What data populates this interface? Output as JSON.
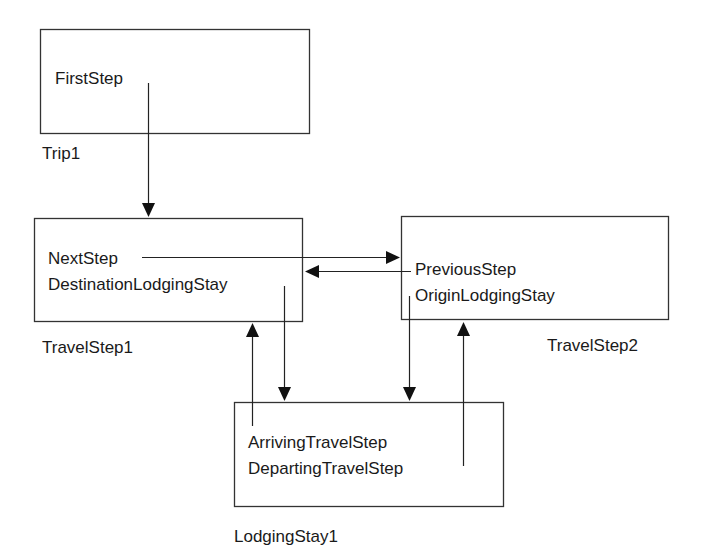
{
  "nodes": [
    {
      "id": "trip1",
      "name": "Trip1",
      "fields": [
        "FirstStep"
      ]
    },
    {
      "id": "travelstep1",
      "name": "TravelStep1",
      "fields": [
        "NextStep",
        "DestinationLodgingStay"
      ]
    },
    {
      "id": "travelstep2",
      "name": "TravelStep2",
      "fields": [
        "PreviousStep",
        "OriginLodgingStay"
      ]
    },
    {
      "id": "lodgingstay1",
      "name": "LodgingStay1",
      "fields": [
        "ArrivingTravelStep",
        "DepartingTravelStep"
      ]
    }
  ],
  "edges": [
    {
      "from": "trip1.FirstStep",
      "to": "travelstep1"
    },
    {
      "from": "travelstep1.NextStep",
      "to": "travelstep2"
    },
    {
      "from": "travelstep2.PreviousStep",
      "to": "travelstep1"
    },
    {
      "from": "travelstep1.DestinationLodgingStay",
      "to": "lodgingstay1"
    },
    {
      "from": "travelstep2.OriginLodgingStay",
      "to": "lodgingstay1"
    },
    {
      "from": "lodgingstay1.ArrivingTravelStep",
      "to": "travelstep1"
    },
    {
      "from": "lodgingstay1.DepartingTravelStep",
      "to": "travelstep2"
    }
  ],
  "colors": {
    "stroke": "#333333",
    "text": "#1a1a1a",
    "background": "#ffffff"
  }
}
